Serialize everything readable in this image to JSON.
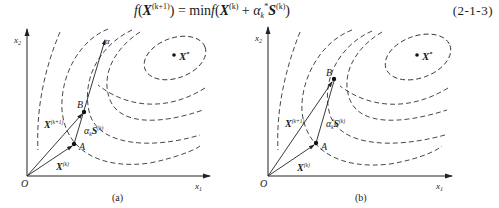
{
  "equation": {
    "lhs_func": "f",
    "lhs_var": "X",
    "lhs_sup": "(k+1)",
    "equals": "=",
    "rhs_op": "min",
    "rhs_func": "f",
    "rhs_var": "X",
    "rhs_sup": "(k)",
    "plus": "+",
    "step_symbol": "α",
    "step_sub": "k",
    "step_sup": "*",
    "dir_var": "S",
    "dir_sup": "(k)",
    "number": "(2-1-3)"
  },
  "figures": [
    {
      "id": "a",
      "caption": "(a)",
      "x_axis_label": "x",
      "x_axis_sub": "1",
      "y_axis_label": "x",
      "y_axis_sub": "2",
      "origin_label": "O",
      "optimum_label": "X",
      "optimum_sup": "*",
      "point_a_label": "A",
      "point_b_label": "B",
      "ray_label": "α",
      "vec_xk_label": "X",
      "vec_xk_sup": "(k)",
      "vec_xk1_label": "X",
      "vec_xk1_sup": "(k+1)",
      "step_label": "α",
      "step_sub": "k",
      "step_dir": "S",
      "step_dir_sup": "(k)"
    },
    {
      "id": "b",
      "caption": "(b)",
      "x_axis_label": "x",
      "x_axis_sub": "1",
      "y_axis_label": "x",
      "y_axis_sub": "2",
      "origin_label": "O",
      "optimum_label": "X",
      "optimum_sup": "*",
      "point_a_label": "A",
      "point_b_label": "B",
      "vec_xk_label": "X",
      "vec_xk_sup": "(k)",
      "vec_xk1_label": "X",
      "vec_xk1_sup": "(k+1)",
      "step_label": "α",
      "step_sub": "k",
      "step_sup": "*",
      "step_dir": "S",
      "step_dir_sup": "(k)"
    }
  ],
  "colors": {
    "line": "#222222",
    "contour": "#333333",
    "background": "#ffffff"
  }
}
